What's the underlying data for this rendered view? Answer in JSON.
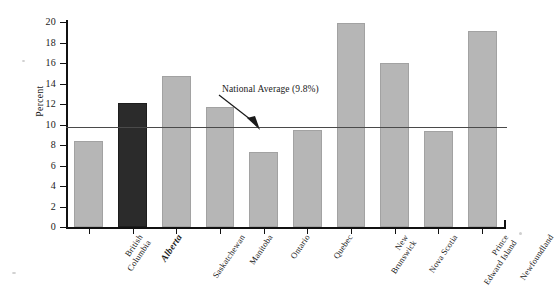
{
  "chart_data": {
    "type": "bar",
    "title": "",
    "xlabel": "",
    "ylabel": "Percent",
    "ylim": [
      0,
      20
    ],
    "ytick_step": 2,
    "yticks": [
      "0",
      "2",
      "4",
      "6",
      "8",
      "10",
      "12",
      "14",
      "16",
      "18",
      "20"
    ],
    "grid": false,
    "legend": "none",
    "categories": [
      "British Columbia",
      "Alberta",
      "Saskatchewan",
      "Manitoba",
      "Ontario",
      "Quebec",
      "New Brunswick",
      "Nova Scotia",
      "Prince Edward Island",
      "Newfoundland"
    ],
    "values": [
      8.4,
      12.1,
      14.7,
      11.7,
      7.3,
      9.5,
      19.9,
      16.0,
      9.4,
      19.1
    ],
    "highlight_category": "Alberta",
    "annotations": [
      {
        "text": "National Average (9.8%)",
        "value": 9.8,
        "kind": "reference-line-label"
      }
    ],
    "reference_line": {
      "label": "National Average (9.8%)",
      "value": 9.8
    },
    "colors": {
      "bar": "#b6b6b6",
      "highlight_bar": "#2b2b2b",
      "axis": "#111111",
      "reference_line": "#4a4a4a",
      "background": "#ffffff"
    }
  },
  "axis": {
    "y_title": "Percent"
  },
  "annotation": {
    "national_average_label": "National Average (9.8%)"
  }
}
